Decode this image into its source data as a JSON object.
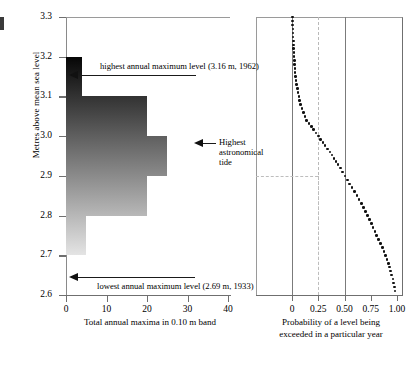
{
  "chart_data": {
    "type": "bar",
    "title": "",
    "panels": [
      {
        "name": "histogram",
        "type": "bar",
        "orientation": "horizontal",
        "ylabel": "Metres above mean sea level",
        "xlabel": "Total annual maxima in 0.10 m band",
        "ylim": [
          2.6,
          3.3
        ],
        "xlim": [
          0,
          44
        ],
        "ytick_labels": [
          "3.3",
          "3.2",
          "3.1",
          "3.0",
          "2.9",
          "2.8",
          "2.7",
          "2.6"
        ],
        "ytick_values": [
          3.3,
          3.2,
          3.1,
          3.0,
          2.9,
          2.8,
          2.7,
          2.6
        ],
        "xtick_labels": [
          "0",
          "10",
          "20",
          "30",
          "40"
        ],
        "xtick_values": [
          0,
          10,
          20,
          30,
          40
        ],
        "grid": false,
        "bands": [
          "3.2-3.3",
          "3.1-3.2",
          "3.0-3.1",
          "2.9-3.0",
          "2.8-2.9",
          "2.7-2.8",
          "2.6-2.7"
        ],
        "band_lows": [
          3.2,
          3.1,
          3.0,
          2.9,
          2.8,
          2.7,
          2.6
        ],
        "values": [
          0,
          4,
          20,
          25,
          20,
          5,
          0
        ],
        "fill": "vertical gradient black (top) to light grey (bottom)"
      },
      {
        "name": "probability",
        "type": "line",
        "xlabel": "Probability of a level being exceeded in a particular year",
        "ylim": [
          2.6,
          3.3
        ],
        "xlim": [
          -0.18,
          1.08
        ],
        "xtick_labels": [
          "0",
          "0.25",
          "0.50",
          "0.75",
          "1.00"
        ],
        "xtick_values": [
          0,
          0.25,
          0.5,
          0.75,
          1.0
        ],
        "grid": false,
        "style": "dotted",
        "y": [
          3.3,
          3.25,
          3.2,
          3.16,
          3.12,
          3.08,
          3.04,
          3.0,
          2.96,
          2.92,
          2.88,
          2.84,
          2.8,
          2.76,
          2.72,
          2.68,
          2.64,
          2.6
        ],
        "x": [
          0.005,
          0.01,
          0.02,
          0.03,
          0.05,
          0.08,
          0.14,
          0.25,
          0.36,
          0.46,
          0.55,
          0.64,
          0.72,
          0.79,
          0.86,
          0.92,
          0.96,
          0.99
        ]
      }
    ],
    "reference_lines": [
      {
        "name": "prob-zero-line",
        "panel": "probability",
        "x": 0.0,
        "style": "solid"
      },
      {
        "name": "prob-half-line",
        "panel": "probability",
        "x": 0.5,
        "style": "solid"
      },
      {
        "name": "prob-quarter-line",
        "panel": "probability",
        "x": 0.25,
        "style": "dashed"
      },
      {
        "name": "hat-guide",
        "panel": "probability",
        "y": 3.0,
        "x_to": 0.25,
        "style": "dashed"
      }
    ],
    "annotations": [
      {
        "name": "highest-annual-maximum",
        "text": "highest annual maximum level (3.16 m, 1962)",
        "level": 3.16,
        "year": 1962
      },
      {
        "name": "highest-astronomical-tide",
        "text": "Highest astronomical tide",
        "lines": [
          "Highest",
          "astronomical",
          "tide"
        ],
        "level": 3.0
      },
      {
        "name": "lowest-annual-maximum",
        "text": "lowest annual maximum level (2.69 m, 1933)",
        "level": 2.69,
        "year": 1933
      }
    ]
  },
  "axes": {
    "left": {
      "ylabel": "Metres above mean sea level",
      "xlabel": "Total annual maxima in 0.10 m band",
      "yticks": [
        "3.3",
        "3.2",
        "3.1",
        "3.0",
        "2.9",
        "2.8",
        "2.7",
        "2.6"
      ],
      "xticks": [
        "0",
        "10",
        "20",
        "30",
        "40"
      ]
    },
    "right": {
      "xlabel_line1": "Probability of a level being",
      "xlabel_line2": "exceeded in a particular year",
      "xticks": [
        "0",
        "0.25",
        "0.50",
        "0.75",
        "1.00"
      ]
    }
  },
  "annotations": {
    "highest": "highest annual maximum level (3.16 m, 1962)",
    "hat_line1": "Highest",
    "hat_line2": "astronomical",
    "hat_line3": "tide",
    "lowest": "lowest annual maximum level (2.69 m, 1933)"
  },
  "colors": {
    "bar_top": "#000000",
    "bar_bottom": "#e3e3e3",
    "axis": "#6f6f6f",
    "curve": "#111111",
    "dashed_guide": "#bdbdbd"
  }
}
